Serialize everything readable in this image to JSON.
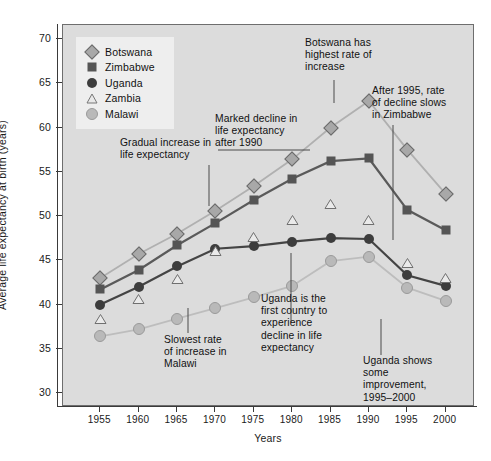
{
  "chart_data": {
    "type": "line",
    "title": "",
    "xlabel": "Years",
    "ylabel": "Average life expectancy at birth (years)",
    "x": [
      1955,
      1960,
      1965,
      1970,
      1975,
      1980,
      1985,
      1990,
      1995,
      2000
    ],
    "xticklabels": [
      "1955",
      "1960",
      "1965",
      "1970",
      "1975",
      "1980",
      "1985",
      "1990",
      "1995",
      "2000"
    ],
    "yticklabels": [
      "30",
      "35",
      "40",
      "45",
      "50",
      "55",
      "60",
      "65",
      "70"
    ],
    "yticks": [
      30,
      35,
      40,
      45,
      50,
      55,
      60,
      65,
      70
    ],
    "xlim": [
      1953,
      2002
    ],
    "ylim": [
      30,
      70
    ],
    "grid": false,
    "legend_position": "top-left",
    "series": [
      {
        "name": "Botswana",
        "marker": "diamond",
        "color": "#a8a8a8",
        "connected": true,
        "values": [
          43.0,
          45.7,
          48.0,
          50.6,
          53.4,
          56.4,
          60.0,
          63.0,
          57.5,
          52.5
        ]
      },
      {
        "name": "Zimbabwe",
        "marker": "square",
        "color": "#555555",
        "connected": true,
        "values": [
          41.7,
          43.9,
          46.7,
          49.2,
          51.8,
          54.2,
          56.2,
          56.5,
          50.7,
          48.4
        ]
      },
      {
        "name": "Uganda",
        "marker": "circle",
        "color": "#3d3d3d",
        "connected": true,
        "values": [
          40.0,
          42.0,
          44.3,
          46.3,
          46.6,
          47.1,
          47.5,
          47.4,
          43.3,
          42.1
        ]
      },
      {
        "name": "Zambia",
        "marker": "triangle",
        "color": "#ffffff",
        "connected": false,
        "values": [
          38.4,
          40.6,
          42.9,
          46.0,
          47.6,
          49.5,
          51.4,
          49.6,
          44.7,
          43.0
        ]
      },
      {
        "name": "Malawi",
        "marker": "dot",
        "color": "#b9b9b9",
        "connected": true,
        "values": [
          36.4,
          37.2,
          38.4,
          39.6,
          40.8,
          42.1,
          44.9,
          45.4,
          41.9,
          40.4
        ]
      }
    ],
    "annotations": [
      {
        "id": "gradual-increase",
        "text": "Gradual increase in\nlife expectancy"
      },
      {
        "id": "marked-decline",
        "text": "Marked decline in\nlife expectancy\nafter 1990"
      },
      {
        "id": "botswana-highest",
        "text": "Botswana has\nhighest rate of\nincrease"
      },
      {
        "id": "zimbabwe-slows",
        "text": "After 1995, rate\nof decline slows\nin Zimbabwe"
      },
      {
        "id": "malawi-slowest",
        "text": "Slowest rate\nof increase in\nMalawi"
      },
      {
        "id": "uganda-first",
        "text": "Uganda is the\nfirst country to\nexperience\ndecline in life\nexpectancy"
      },
      {
        "id": "uganda-improves",
        "text": "Uganda shows\nsome\nimprovement,\n1995–2000"
      }
    ]
  },
  "legend": {
    "items": [
      {
        "label": "Botswana"
      },
      {
        "label": "Zimbabwe"
      },
      {
        "label": "Uganda"
      },
      {
        "label": "Zambia"
      },
      {
        "label": "Malawi"
      }
    ]
  },
  "annotations": {
    "gradual_increase": {
      "l1": "Gradual increase in",
      "l2": "life expectancy"
    },
    "marked_decline": {
      "l1": "Marked decline in",
      "l2": "life expectancy",
      "l3": "after 1990"
    },
    "botswana_highest": {
      "l1": "Botswana has",
      "l2": "highest rate of",
      "l3": "increase"
    },
    "zimbabwe_slows": {
      "l1": "After 1995, rate",
      "l2": "of decline slows",
      "l3": "in Zimbabwe"
    },
    "malawi_slowest": {
      "l1": "Slowest rate",
      "l2": "of increase in",
      "l3": "Malawi"
    },
    "uganda_first": {
      "l1": "Uganda is the",
      "l2": "first country to",
      "l3": "experience",
      "l4": "decline in life",
      "l5": "expectancy"
    },
    "uganda_improves": {
      "l1": "Uganda shows",
      "l2": "some",
      "l3": "improvement,",
      "l4": "1995–2000"
    }
  },
  "axis": {
    "x_title": "Years",
    "y_title": "Average life expectancy at birth (years)"
  }
}
